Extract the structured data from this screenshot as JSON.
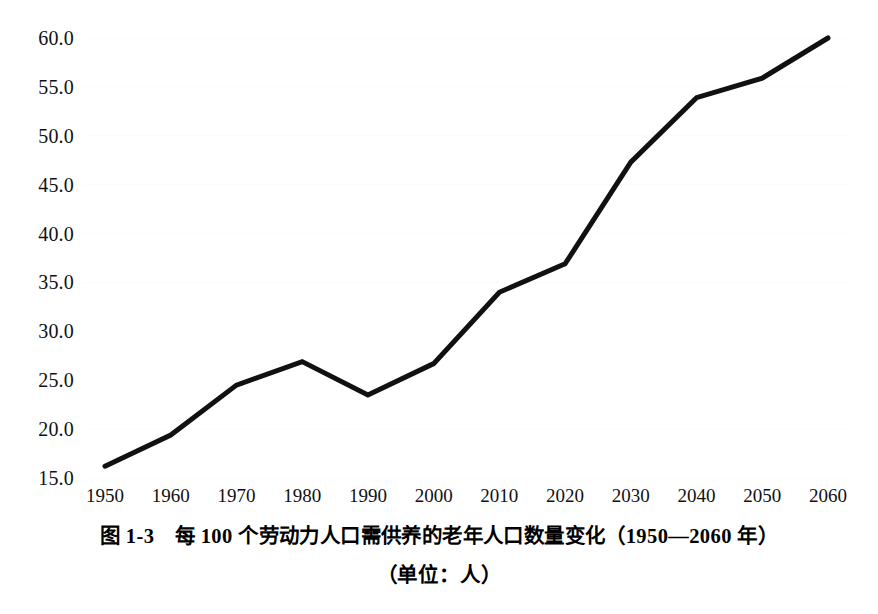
{
  "chart_data": {
    "type": "line",
    "title": "图 1-3　每 100 个劳动力人口需供养的老年人口数量变化（1950—2060 年）",
    "subtitle": "（单位：人）",
    "xlabel": "",
    "ylabel": "",
    "x": [
      1950,
      1960,
      1970,
      1980,
      1990,
      2000,
      2010,
      2020,
      2030,
      2040,
      2050,
      2060
    ],
    "categories": [
      "1950",
      "1960",
      "1970",
      "1980",
      "1990",
      "2000",
      "2010",
      "2020",
      "2030",
      "2040",
      "2050",
      "2060"
    ],
    "values": [
      16.2,
      19.4,
      24.5,
      26.9,
      23.5,
      26.7,
      34.0,
      36.9,
      47.3,
      53.9,
      55.9,
      60.0
    ],
    "series": [
      {
        "name": "每100个劳动力人口需供养的老年人口数量",
        "values": [
          16.2,
          19.4,
          24.5,
          26.9,
          23.5,
          26.7,
          34.0,
          36.9,
          47.3,
          53.9,
          55.9,
          60.0
        ]
      }
    ],
    "ylim": [
      15.0,
      60.0
    ],
    "xlim": [
      1950,
      2060
    ],
    "y_ticks": [
      15.0,
      20.0,
      25.0,
      30.0,
      35.0,
      40.0,
      45.0,
      50.0,
      55.0,
      60.0
    ],
    "y_tick_labels": [
      "15.0",
      "20.0",
      "25.0",
      "30.0",
      "35.0",
      "40.0",
      "45.0",
      "50.0",
      "55.0",
      "60.0"
    ],
    "x_ticks": [
      1950,
      1960,
      1970,
      1980,
      1990,
      2000,
      2010,
      2020,
      2030,
      2040,
      2050,
      2060
    ],
    "x_tick_labels": [
      "1950",
      "1960",
      "1970",
      "1980",
      "1990",
      "2000",
      "2010",
      "2020",
      "2030",
      "2040",
      "2050",
      "2060"
    ],
    "grid": false,
    "legend": null,
    "legend_position": "none",
    "line_color": "#111111",
    "line_width": 5,
    "markers": false,
    "background_color": "#ffffff"
  },
  "caption": {
    "figure_label": "图 1-3　每 100 个劳动力人口需供养的老年人口数量变化（1950—2060 年）",
    "unit_note": "（单位：人）"
  }
}
